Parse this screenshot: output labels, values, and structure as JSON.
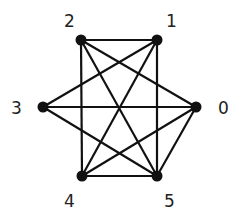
{
  "diagram": {
    "type": "graph",
    "colors": {
      "edge": "#111111",
      "node": "#111111",
      "label": "#222222",
      "background": "#ffffff"
    },
    "nodes": [
      {
        "id": "0",
        "label": "0",
        "x": 196,
        "y": 107,
        "lx": 218,
        "ly": 114
      },
      {
        "id": "1",
        "label": "1",
        "x": 157,
        "y": 40,
        "lx": 166,
        "ly": 27
      },
      {
        "id": "2",
        "label": "2",
        "x": 81,
        "y": 40,
        "lx": 64,
        "ly": 27
      },
      {
        "id": "3",
        "label": "3",
        "x": 43,
        "y": 107,
        "lx": 11,
        "ly": 114
      },
      {
        "id": "4",
        "label": "4",
        "x": 82,
        "y": 176,
        "lx": 64,
        "ly": 207
      },
      {
        "id": "5",
        "label": "5",
        "x": 157,
        "y": 176,
        "lx": 164,
        "ly": 207
      }
    ],
    "edges": [
      [
        "2",
        "1"
      ],
      [
        "2",
        "4"
      ],
      [
        "2",
        "5"
      ],
      [
        "2",
        "0"
      ],
      [
        "1",
        "3"
      ],
      [
        "1",
        "4"
      ],
      [
        "1",
        "5"
      ],
      [
        "3",
        "0"
      ],
      [
        "3",
        "5"
      ],
      [
        "0",
        "4"
      ],
      [
        "0",
        "5"
      ],
      [
        "4",
        "5"
      ]
    ]
  }
}
